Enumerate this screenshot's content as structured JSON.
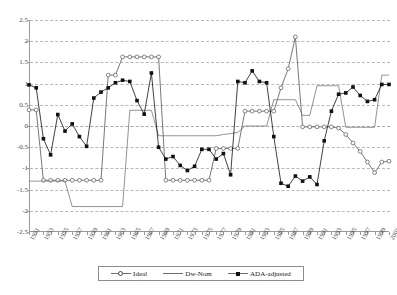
{
  "chart_data": {
    "type": "line",
    "title": "",
    "xlabel": "",
    "ylabel": "",
    "ylim": [
      -2.5,
      2.5
    ],
    "ytick_step": 0.5,
    "yticks": [
      2.5,
      2,
      1.5,
      1,
      0.5,
      0,
      -0.5,
      -1,
      -1.5,
      -2,
      -2.5
    ],
    "ytick_labels": [
      "2.5",
      "2",
      "1.5",
      "1",
      "0.5",
      "0",
      "-0.5",
      "-1",
      "-1.5",
      "-2",
      "-2.5"
    ],
    "grid": true,
    "legend_position": "bottom",
    "x": [
      1951,
      1952,
      1953,
      1954,
      1955,
      1956,
      1957,
      1958,
      1959,
      1960,
      1961,
      1962,
      1963,
      1964,
      1965,
      1966,
      1967,
      1968,
      1969,
      1970,
      1971,
      1972,
      1973,
      1974,
      1975,
      1976,
      1977,
      1978,
      1979,
      1980,
      1981,
      1982,
      1983,
      1984,
      1985,
      1986,
      1987,
      1988,
      1989,
      1990,
      1991,
      1992,
      1993,
      1994,
      1995,
      1996,
      1997,
      1998,
      1999,
      2000,
      2001
    ],
    "xtick_labels": [
      "1951",
      "1953",
      "1955",
      "1957",
      "1959",
      "1961",
      "1963",
      "1965",
      "1967",
      "1969",
      "1971",
      "1973",
      "1975",
      "1977",
      "1979",
      "1981",
      "1983",
      "1985",
      "1987",
      "1989",
      "1991",
      "1993",
      "1995",
      "1997",
      "1999",
      "2001"
    ],
    "series": [
      {
        "name": "Ideal",
        "marker": "open-circle",
        "color": "#555555",
        "values": [
          0.38,
          0.38,
          -1.28,
          -1.28,
          -1.28,
          -1.28,
          -1.28,
          -1.28,
          -1.28,
          -1.28,
          -1.28,
          1.2,
          1.2,
          1.63,
          1.63,
          1.63,
          1.63,
          1.63,
          1.63,
          -1.28,
          -1.28,
          -1.28,
          -1.28,
          -1.28,
          -1.28,
          -1.28,
          -0.53,
          -0.53,
          -0.53,
          -0.53,
          0.35,
          0.35,
          0.35,
          0.35,
          0.35,
          0.9,
          1.35,
          2.1,
          -0.02,
          -0.02,
          -0.02,
          -0.02,
          -0.02,
          -0.05,
          -0.2,
          -0.4,
          -0.6,
          -0.85,
          -1.1,
          -0.85,
          -0.83
        ]
      },
      {
        "name": "Dw-Nom",
        "marker": "none",
        "color": "#777777",
        "values": [
          -1.3,
          -1.3,
          -1.3,
          -1.3,
          -1.3,
          -1.3,
          -1.9,
          -1.9,
          -1.9,
          -1.9,
          -1.9,
          -1.9,
          -1.9,
          -1.9,
          0.37,
          0.37,
          0.37,
          0.37,
          -0.23,
          -0.23,
          -0.23,
          -0.23,
          -0.23,
          -0.23,
          -0.23,
          -0.23,
          -0.23,
          -0.2,
          -0.18,
          -0.15,
          0.0,
          0.0,
          0.0,
          0.0,
          0.62,
          0.62,
          0.62,
          0.62,
          0.25,
          0.25,
          0.95,
          0.95,
          0.95,
          0.95,
          -0.03,
          -0.03,
          -0.03,
          -0.03,
          -0.03,
          1.2,
          1.2
        ]
      },
      {
        "name": "ADA-adjusted",
        "marker": "filled-square",
        "color": "#111111",
        "values": [
          0.97,
          0.9,
          -0.3,
          -0.68,
          0.27,
          -0.12,
          0.05,
          -0.25,
          -0.48,
          0.66,
          0.8,
          0.9,
          1.02,
          1.08,
          1.05,
          0.6,
          0.28,
          1.25,
          -0.5,
          -0.78,
          -0.72,
          -0.93,
          -1.05,
          -0.95,
          -0.55,
          -0.55,
          -0.78,
          -0.65,
          -1.15,
          1.05,
          1.02,
          1.3,
          1.05,
          1.02,
          -0.25,
          -1.35,
          -1.42,
          -1.18,
          -1.3,
          -1.2,
          -1.38,
          -0.35,
          0.35,
          0.75,
          0.78,
          0.92,
          0.72,
          0.58,
          0.62,
          0.98,
          0.98
        ]
      }
    ]
  },
  "legend": {
    "entries": [
      {
        "label": "Ideal",
        "marker": "open-circle"
      },
      {
        "label": "Dw-Nom",
        "marker": "line"
      },
      {
        "label": "ADA-adjusted",
        "marker": "filled-square"
      }
    ]
  },
  "caption": {
    "text": ""
  }
}
